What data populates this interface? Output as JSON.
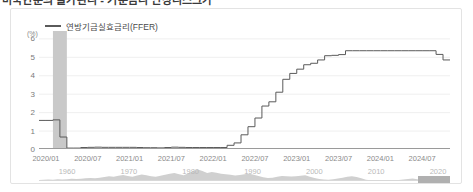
{
  "page_title": "미국연준의 물가관리 - 기준금리 인상리스크가",
  "card": {
    "legend": {
      "icon": "line-swatch",
      "label": "연방기금실효금리(FFER)"
    },
    "unit_label": "(%)"
  },
  "chart_data": {
    "type": "line",
    "title": "연방기금실효금리(FFER)",
    "xlabel": "",
    "ylabel": "(%)",
    "ylim": [
      0,
      6.4
    ],
    "yticks": [
      0,
      1,
      2,
      3,
      4,
      5,
      6
    ],
    "ytick_labels": [
      "0",
      "1",
      "2",
      "3",
      "4",
      "5",
      "6"
    ],
    "grid": true,
    "legend_position": "top-left",
    "xlim": [
      "2019/12",
      "2024/11"
    ],
    "xticks": [
      "2020/01",
      "2020/07",
      "2021/01",
      "2021/07",
      "2022/01",
      "2022/07",
      "2023/01",
      "2023/07",
      "2024/01",
      "2024/07"
    ],
    "series": [
      {
        "name": "연방기금실효금리(FFER)",
        "color": "#5a5a5a",
        "step": true,
        "x": [
          "2019/12",
          "2020/01",
          "2020/02",
          "2020/03",
          "2020/04",
          "2020/05",
          "2020/06",
          "2020/07",
          "2020/08",
          "2020/09",
          "2020/10",
          "2020/11",
          "2020/12",
          "2021/01",
          "2021/02",
          "2021/03",
          "2021/04",
          "2021/05",
          "2021/06",
          "2021/07",
          "2021/08",
          "2021/09",
          "2021/10",
          "2021/11",
          "2021/12",
          "2022/01",
          "2022/02",
          "2022/03",
          "2022/04",
          "2022/05",
          "2022/06",
          "2022/07",
          "2022/08",
          "2022/09",
          "2022/10",
          "2022/11",
          "2022/12",
          "2023/01",
          "2023/02",
          "2023/03",
          "2023/04",
          "2023/05",
          "2023/06",
          "2023/07",
          "2023/08",
          "2023/09",
          "2023/10",
          "2023/11",
          "2023/12",
          "2024/01",
          "2024/02",
          "2024/03",
          "2024/04",
          "2024/05",
          "2024/06",
          "2024/07",
          "2024/08",
          "2024/09",
          "2024/10",
          "2024/11"
        ],
        "y": [
          1.55,
          1.55,
          1.58,
          0.65,
          0.05,
          0.05,
          0.08,
          0.09,
          0.1,
          0.09,
          0.09,
          0.09,
          0.09,
          0.09,
          0.08,
          0.07,
          0.07,
          0.06,
          0.08,
          0.1,
          0.09,
          0.08,
          0.08,
          0.08,
          0.08,
          0.08,
          0.08,
          0.2,
          0.33,
          0.77,
          1.21,
          1.68,
          2.33,
          2.56,
          3.08,
          3.78,
          4.1,
          4.33,
          4.57,
          4.65,
          4.83,
          5.06,
          5.08,
          5.12,
          5.33,
          5.33,
          5.33,
          5.33,
          5.33,
          5.33,
          5.33,
          5.33,
          5.33,
          5.33,
          5.33,
          5.33,
          5.33,
          5.13,
          4.83,
          4.83
        ]
      }
    ],
    "shaded_regions": [
      {
        "name": "recession-band",
        "start": "2020/02",
        "end": "2020/04",
        "color": "#c9c9c9"
      }
    ]
  },
  "range_selector": {
    "name": "date-range-selector",
    "ticks": [
      "1960",
      "1970",
      "1980",
      "1990",
      "2000",
      "2010",
      "2020"
    ],
    "handle_label": ""
  }
}
